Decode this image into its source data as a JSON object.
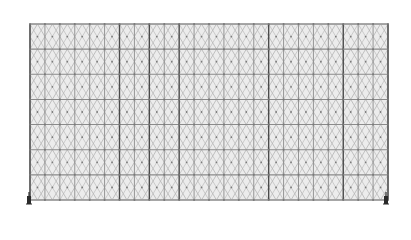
{
  "diagram": {
    "type": "structural-frame",
    "frame": {
      "x0": 30,
      "y0": 24,
      "x1": 388,
      "y1": 200
    },
    "bays": 24,
    "storeys": 7,
    "heavy_columns": [
      6,
      8,
      10,
      16,
      21
    ],
    "supports": [
      {
        "position": "bottom-left",
        "x": 29,
        "y": 200,
        "symbol": "pin-support"
      },
      {
        "position": "bottom-right",
        "x": 386,
        "y": 200,
        "symbol": "pin-support"
      }
    ],
    "colors": {
      "background": "#ffffff",
      "panel_fill": "#ececec",
      "grid_line": "#8a8a8a",
      "heavy_line": "#4a4a4a",
      "brace_line": "#b4b4b4",
      "node": "#7a7a7a",
      "support": "#2a2a2a"
    }
  }
}
